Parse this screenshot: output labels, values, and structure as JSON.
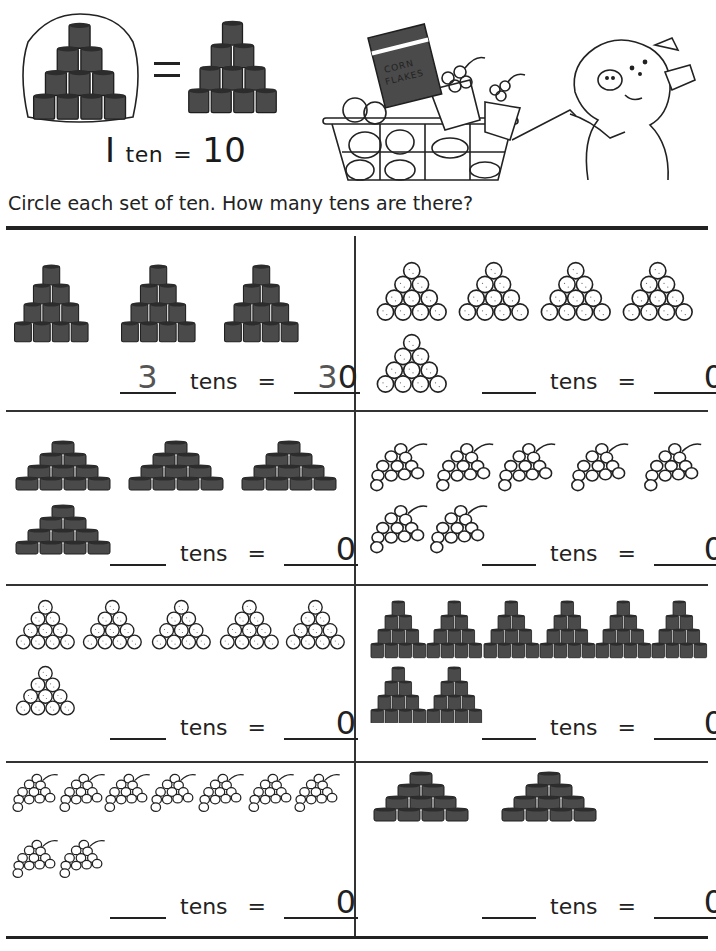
{
  "header": {
    "equation": {
      "one": "I",
      "unit": "ten",
      "equals": "=",
      "value": "10"
    },
    "illustration": {
      "cereal_box_line1": "CORN",
      "cereal_box_line2": "FLAKES"
    }
  },
  "instruction": "Circle each set of ten. How many tens are there?",
  "labels": {
    "tens": "tens",
    "equals": "="
  },
  "colors": {
    "ink": "#222222",
    "can_fill": "#4a4a4a",
    "paper": "#ffffff"
  },
  "problems": [
    {
      "id": "p1",
      "object": "tall cans",
      "groups": 3,
      "tens_answer": "3",
      "total_answer": "30",
      "tens_answer_style": "dashed",
      "total_prefix_dashed": "3",
      "total_suffix": "0"
    },
    {
      "id": "p2",
      "object": "balls",
      "groups": 5,
      "tens_answer": "",
      "total_answer": "0"
    },
    {
      "id": "p3",
      "object": "flat cans",
      "groups": 4,
      "tens_answer": "",
      "total_answer": "0"
    },
    {
      "id": "p4",
      "object": "grapes",
      "groups": 7,
      "tens_answer": "",
      "total_answer": "0"
    },
    {
      "id": "p5",
      "object": "balls",
      "groups": 6,
      "tens_answer": "",
      "total_answer": "0"
    },
    {
      "id": "p6",
      "object": "small cans",
      "groups": 8,
      "tens_answer": "",
      "total_answer": "0"
    },
    {
      "id": "p7",
      "object": "grapes",
      "groups": 9,
      "tens_answer": "",
      "total_answer": "0"
    },
    {
      "id": "p8",
      "object": "flat cans",
      "groups": 2,
      "tens_answer": "",
      "total_answer": "0"
    }
  ]
}
